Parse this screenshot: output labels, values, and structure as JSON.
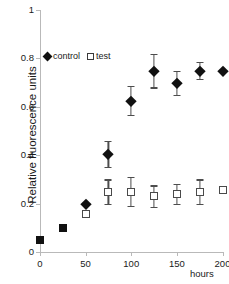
{
  "chart_data": {
    "type": "scatter",
    "title": "",
    "xlabel": "hours",
    "ylabel": "Relative fluorescence units",
    "xlim": [
      0,
      200
    ],
    "ylim": [
      0,
      1
    ],
    "xticks": [
      0,
      50,
      100,
      150,
      200
    ],
    "xtick_labels": [
      "0",
      "50",
      "100",
      "150",
      "200"
    ],
    "yticks": [
      0,
      0.2,
      0.4,
      0.6,
      0.8,
      1
    ],
    "ytick_labels": [
      "0",
      "0.2",
      "0.4",
      "0.6",
      "0.8",
      "1"
    ],
    "grid": false,
    "legend_position": "upper left",
    "series": [
      {
        "name": "control",
        "marker": "filled-diamond",
        "color": "#111111",
        "x": [
          0,
          25,
          50,
          75,
          100,
          125,
          150,
          175,
          200
        ],
        "values": [
          0.05,
          0.1,
          0.2,
          0.405,
          0.625,
          0.75,
          0.7,
          0.75,
          0.75
        ],
        "errors": [
          0,
          0,
          0,
          0.055,
          0.06,
          0.07,
          0.05,
          0.035,
          0
        ]
      },
      {
        "name": "test",
        "marker": "open-square",
        "color": "#4a4a4a",
        "x": [
          0,
          25,
          50,
          75,
          100,
          125,
          150,
          175,
          200
        ],
        "values": [
          0.05,
          0.1,
          0.155,
          0.25,
          0.25,
          0.23,
          0.24,
          0.25,
          0.255
        ],
        "errors": [
          0,
          0,
          0,
          0.05,
          0.06,
          0.045,
          0.04,
          0.05,
          0
        ]
      }
    ]
  },
  "legend": {
    "entries": [
      {
        "label": "control",
        "marker": "filled-diamond"
      },
      {
        "label": "test",
        "marker": "open-square"
      }
    ]
  },
  "axes": {
    "y_title": "Relative fluorescence units",
    "x_title": "hours"
  }
}
